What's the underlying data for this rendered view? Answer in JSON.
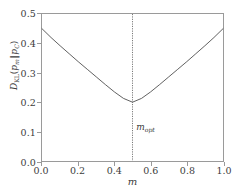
{
  "chart_data": {
    "type": "line",
    "title": "",
    "xlabel": "m",
    "ylabel": "D_KL(p_m||p_C)",
    "xlim": [
      0.0,
      1.0
    ],
    "ylim": [
      0.0,
      0.5
    ],
    "grid": false,
    "legend": null,
    "xticks": [
      "0.0",
      "0.2",
      "0.4",
      "0.6",
      "0.8",
      "1.0"
    ],
    "xtick_values": [
      0.0,
      0.2,
      0.4,
      0.6,
      0.8,
      1.0
    ],
    "yticks": [
      "0.0",
      "0.1",
      "0.2",
      "0.3",
      "0.4",
      "0.5"
    ],
    "ytick_values": [
      0.0,
      0.1,
      0.2,
      0.3,
      0.4,
      0.5
    ],
    "series": [
      {
        "name": "DKL curve",
        "color": "#4d4d4d",
        "linewidth": 0.9,
        "x": [
          0.0,
          0.05,
          0.1,
          0.15,
          0.2,
          0.25,
          0.3,
          0.35,
          0.4,
          0.45,
          0.5,
          0.55,
          0.6,
          0.65,
          0.7,
          0.75,
          0.8,
          0.85,
          0.9,
          0.95,
          1.0
        ],
        "values": [
          0.45,
          0.42,
          0.392,
          0.365,
          0.338,
          0.312,
          0.286,
          0.26,
          0.235,
          0.213,
          0.2,
          0.213,
          0.235,
          0.26,
          0.286,
          0.312,
          0.338,
          0.365,
          0.392,
          0.42,
          0.45
        ]
      }
    ],
    "annotations": [
      {
        "name": "m-opt-vline",
        "type": "vline",
        "x": 0.5,
        "label": "m_opt",
        "label_base": "m",
        "label_sub": "opt",
        "label_x": 0.52,
        "label_y": 0.115,
        "linestyle": "dotted",
        "color": "#555555"
      }
    ],
    "minimum": {
      "x": 0.5,
      "y": 0.2
    },
    "endpoints": {
      "left": {
        "x": 0.0,
        "y": 0.45
      },
      "right": {
        "x": 1.0,
        "y": 0.45
      }
    }
  },
  "ylabel_parts": {
    "d": "D",
    "d_sub": "KL",
    "open": "(",
    "p1": "p",
    "p1_sub": "m",
    "bars": "‖",
    "p2": "p",
    "p2_sub": "C",
    "close": ")"
  },
  "colors": {
    "axis": "#9a9a9a",
    "curve": "#4d4d4d",
    "vline": "#555555",
    "text": "#3c3c3c",
    "background": "#ffffff"
  }
}
